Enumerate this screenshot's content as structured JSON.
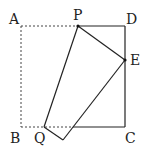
{
  "diagram": {
    "type": "geometry-fold",
    "labels": {
      "A": "A",
      "B": "B",
      "C": "C",
      "D": "D",
      "E": "E",
      "P": "P",
      "Q": "Q"
    },
    "points": {
      "A": [
        21,
        26
      ],
      "B": [
        21,
        127
      ],
      "C": [
        125,
        127
      ],
      "D": [
        125,
        26
      ],
      "E": [
        125,
        60
      ],
      "P": [
        78,
        26
      ],
      "Q": [
        44,
        127
      ],
      "B_folded": [
        63,
        140
      ],
      "bottom_cross": [
        73,
        127
      ]
    },
    "colors": {
      "line": "#222222",
      "dashed": "#444444",
      "text": "#222222"
    }
  }
}
